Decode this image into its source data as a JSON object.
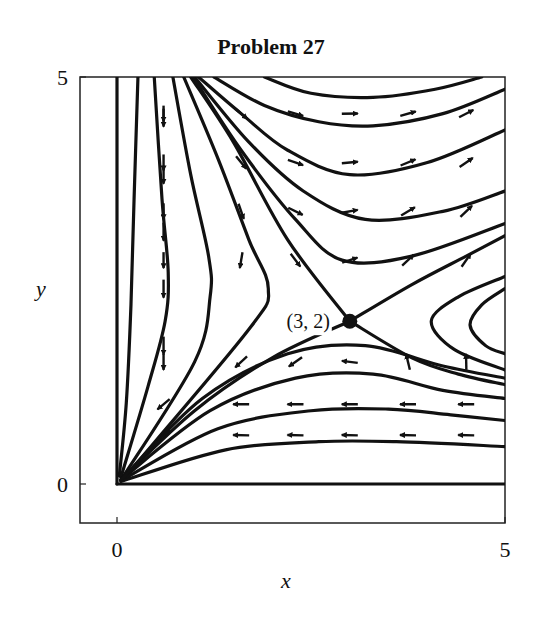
{
  "chart_data": {
    "type": "phase-portrait",
    "title": "Problem 27",
    "xlabel": "x",
    "ylabel": "y",
    "xlim": [
      0,
      5
    ],
    "ylim": [
      0,
      5
    ],
    "x_ticks": [
      {
        "value": 0,
        "label": "0"
      },
      {
        "value": 5,
        "label": "5"
      }
    ],
    "y_ticks": [
      {
        "value": 0,
        "label": "0"
      },
      {
        "value": 5,
        "label": "5"
      }
    ],
    "grid": false,
    "legend": null,
    "equilibrium": {
      "x": 3,
      "y": 2,
      "label": "(3, 2)",
      "type": "saddle"
    },
    "trajectories": [
      {
        "name": "y-axis",
        "points": [
          [
            0,
            5
          ],
          [
            0,
            0
          ]
        ]
      },
      {
        "name": "x-axis",
        "points": [
          [
            5,
            0
          ],
          [
            0,
            0
          ]
        ]
      },
      {
        "name": "left-1",
        "points": [
          [
            0.27,
            5
          ],
          [
            0.22,
            3.5
          ],
          [
            0.18,
            2.2
          ],
          [
            0.12,
            1.0
          ],
          [
            0.03,
            0.1
          ]
        ]
      },
      {
        "name": "left-2",
        "points": [
          [
            0.48,
            5
          ],
          [
            0.58,
            3.5
          ],
          [
            0.66,
            2.6
          ],
          [
            0.62,
            2.0
          ],
          [
            0.4,
            1.2
          ],
          [
            0.05,
            0.08
          ]
        ]
      },
      {
        "name": "left-3",
        "points": [
          [
            0.72,
            5
          ],
          [
            0.95,
            3.8
          ],
          [
            1.18,
            2.8
          ],
          [
            1.2,
            2.3
          ],
          [
            1.0,
            1.5
          ],
          [
            0.06,
            0.06
          ]
        ]
      },
      {
        "name": "left-4",
        "points": [
          [
            0.86,
            5
          ],
          [
            1.3,
            4.0
          ],
          [
            1.7,
            3.0
          ],
          [
            1.95,
            2.4
          ],
          [
            1.7,
            1.9
          ],
          [
            0.08,
            0.06
          ]
        ]
      },
      {
        "name": "separatrix-stable-upper",
        "points": [
          [
            0.95,
            5
          ],
          [
            1.5,
            4.2
          ],
          [
            2.2,
            3.0
          ],
          [
            3,
            2
          ]
        ]
      },
      {
        "name": "separatrix-stable-lower",
        "points": [
          [
            0.05,
            0.05
          ],
          [
            1,
            0.9
          ],
          [
            2,
            1.55
          ],
          [
            3,
            2
          ]
        ]
      },
      {
        "name": "separatrix-unstable-up",
        "points": [
          [
            3,
            2
          ],
          [
            3.8,
            2.45
          ],
          [
            4.5,
            2.8
          ],
          [
            5,
            3.05
          ]
        ]
      },
      {
        "name": "separatrix-unstable-down",
        "points": [
          [
            3,
            2
          ],
          [
            3.8,
            1.55
          ],
          [
            4.4,
            1.35
          ],
          [
            5,
            1.22
          ]
        ]
      },
      {
        "name": "upper-1",
        "points": [
          [
            1.05,
            5
          ],
          [
            1.6,
            4.55
          ],
          [
            2.2,
            4.1
          ],
          [
            3,
            3.8
          ],
          [
            4,
            3.95
          ],
          [
            5,
            4.35
          ]
        ]
      },
      {
        "name": "upper-2",
        "points": [
          [
            1.25,
            5
          ],
          [
            1.9,
            4.65
          ],
          [
            2.6,
            4.45
          ],
          [
            3.3,
            4.4
          ],
          [
            4.2,
            4.55
          ],
          [
            5,
            4.85
          ]
        ]
      },
      {
        "name": "upper-3",
        "points": [
          [
            1.9,
            5
          ],
          [
            2.5,
            4.8
          ],
          [
            3.3,
            4.75
          ],
          [
            4.1,
            4.85
          ],
          [
            4.7,
            5
          ]
        ]
      },
      {
        "name": "upper-4",
        "points": [
          [
            1.0,
            5
          ],
          [
            1.7,
            4.2
          ],
          [
            2.4,
            3.6
          ],
          [
            3.2,
            3.25
          ],
          [
            4.2,
            3.35
          ],
          [
            5,
            3.6
          ]
        ]
      },
      {
        "name": "upper-5",
        "points": [
          [
            0.98,
            5
          ],
          [
            1.6,
            4.1
          ],
          [
            2.3,
            3.25
          ],
          [
            2.9,
            2.75
          ],
          [
            3.8,
            2.8
          ],
          [
            5,
            3.2
          ]
        ]
      },
      {
        "name": "right-1",
        "points": [
          [
            5,
            2.55
          ],
          [
            4.4,
            2.3
          ],
          [
            4.05,
            2.0
          ],
          [
            4.35,
            1.65
          ],
          [
            5,
            1.4
          ]
        ]
      },
      {
        "name": "right-2",
        "points": [
          [
            5,
            2.4
          ],
          [
            4.7,
            2.2
          ],
          [
            4.55,
            1.95
          ],
          [
            4.75,
            1.7
          ],
          [
            5,
            1.6
          ]
        ]
      },
      {
        "name": "lower-1",
        "points": [
          [
            0.05,
            0.05
          ],
          [
            1.2,
            0.9
          ],
          [
            2.3,
            1.3
          ],
          [
            3.3,
            1.35
          ],
          [
            4.2,
            1.15
          ],
          [
            5,
            1.05
          ]
        ]
      },
      {
        "name": "lower-2",
        "points": [
          [
            0.05,
            0.04
          ],
          [
            1.3,
            0.68
          ],
          [
            2.5,
            0.9
          ],
          [
            3.5,
            0.92
          ],
          [
            4.3,
            0.85
          ],
          [
            5,
            0.78
          ]
        ]
      },
      {
        "name": "lower-3",
        "points": [
          [
            0.05,
            0.03
          ],
          [
            1.4,
            0.42
          ],
          [
            2.6,
            0.52
          ],
          [
            3.6,
            0.52
          ],
          [
            5,
            0.46
          ]
        ]
      },
      {
        "name": "lower-4",
        "points": [
          [
            0.05,
            0.05
          ],
          [
            1.1,
            1.05
          ],
          [
            2.2,
            1.6
          ],
          [
            3.2,
            1.7
          ],
          [
            4.2,
            1.45
          ],
          [
            5,
            1.3
          ]
        ]
      }
    ],
    "direction_field_note": "short arrows: right/down-right in upper region, down in left region, left in lower region, vertical on right saddle-branch region"
  }
}
